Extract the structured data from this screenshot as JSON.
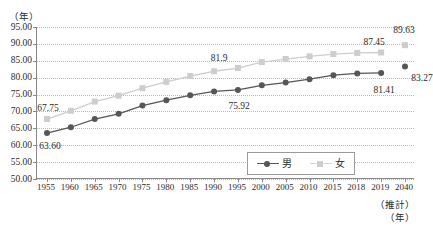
{
  "axes": {
    "y_unit": "（年）",
    "x_unit": "（年）",
    "x_note": "（推計）",
    "y_ticks": [
      "95.00",
      "90.00",
      "85.00",
      "80.00",
      "75.00",
      "70.00",
      "65.00",
      "60.00",
      "55.00",
      "50.00"
    ],
    "x_ticks": [
      "1955",
      "1960",
      "1965",
      "1970",
      "1975",
      "1980",
      "1985",
      "1990",
      "1995",
      "2000",
      "2005",
      "2010",
      "2015",
      "2018",
      "2019",
      "2040"
    ]
  },
  "legend": {
    "items": [
      {
        "label": "男",
        "marker": "circle",
        "color": "#565656"
      },
      {
        "label": "女",
        "marker": "square",
        "color": "#cdcdcd"
      }
    ]
  },
  "colors": {
    "male": "#565656",
    "female": "#cdcdcd",
    "axis": "#8a8a8a",
    "grid": "#b9b9b9",
    "text": "#2b2b2b"
  },
  "annotations": [
    {
      "text": "63.60",
      "series": "male",
      "category": "1955"
    },
    {
      "text": "67.75",
      "series": "female",
      "category": "1955"
    },
    {
      "text": "75.92",
      "series": "male",
      "category": "1990"
    },
    {
      "text": "81.9",
      "series": "female",
      "category": "1990"
    },
    {
      "text": "81.41",
      "series": "male",
      "category": "2019"
    },
    {
      "text": "87.45",
      "series": "female",
      "category": "2019"
    },
    {
      "text": "83.27",
      "series": "male",
      "category": "2040"
    },
    {
      "text": "89.63",
      "series": "female",
      "category": "2040"
    }
  ],
  "chart_data": {
    "type": "line",
    "title": "",
    "xlabel": "（年）",
    "ylabel": "（年）",
    "ylim": [
      50.0,
      95.0
    ],
    "ytick_step": 5.0,
    "grid": true,
    "legend_position": "bottom-center",
    "categories": [
      "1955",
      "1960",
      "1965",
      "1970",
      "1975",
      "1980",
      "1985",
      "1990",
      "1995",
      "2000",
      "2005",
      "2010",
      "2015",
      "2018",
      "2019",
      "2040"
    ],
    "series": [
      {
        "name": "男",
        "color": "#565656",
        "marker": "circle",
        "values": [
          63.6,
          65.32,
          67.74,
          69.31,
          71.73,
          73.35,
          74.78,
          75.92,
          76.38,
          77.72,
          78.56,
          79.55,
          80.75,
          81.25,
          81.41,
          83.27
        ],
        "projected_index": 15
      },
      {
        "name": "女",
        "color": "#cdcdcd",
        "marker": "square",
        "values": [
          67.75,
          70.19,
          72.92,
          74.66,
          76.89,
          78.76,
          80.48,
          81.9,
          82.85,
          84.6,
          85.52,
          86.3,
          86.99,
          87.32,
          87.45,
          89.63
        ],
        "projected_index": 15
      }
    ]
  }
}
